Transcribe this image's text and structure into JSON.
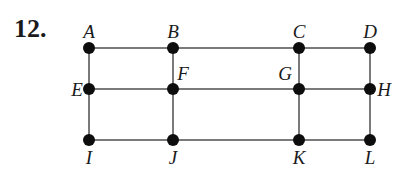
{
  "problem_number": "12.",
  "colors": {
    "edge": "#7a7a7a",
    "node": "#0d0d0d",
    "text": "#1a1a1a"
  },
  "nodes": [
    {
      "id": "A",
      "x": 89,
      "y": 48,
      "lx": 89,
      "ly": 38,
      "anchor": "middle"
    },
    {
      "id": "B",
      "x": 173,
      "y": 48,
      "lx": 173,
      "ly": 38,
      "anchor": "middle"
    },
    {
      "id": "C",
      "x": 299,
      "y": 48,
      "lx": 299,
      "ly": 38,
      "anchor": "middle"
    },
    {
      "id": "D",
      "x": 370,
      "y": 48,
      "lx": 370,
      "ly": 38,
      "anchor": "middle"
    },
    {
      "id": "E",
      "x": 89,
      "y": 89,
      "lx": 77,
      "ly": 96,
      "anchor": "middle"
    },
    {
      "id": "F",
      "x": 173,
      "y": 89,
      "lx": 183,
      "ly": 80,
      "anchor": "middle"
    },
    {
      "id": "G",
      "x": 299,
      "y": 89,
      "lx": 285,
      "ly": 80,
      "anchor": "middle"
    },
    {
      "id": "H",
      "x": 370,
      "y": 89,
      "lx": 384,
      "ly": 96,
      "anchor": "middle"
    },
    {
      "id": "I",
      "x": 89,
      "y": 140,
      "lx": 89,
      "ly": 164,
      "anchor": "middle"
    },
    {
      "id": "J",
      "x": 173,
      "y": 140,
      "lx": 173,
      "ly": 164,
      "anchor": "middle"
    },
    {
      "id": "K",
      "x": 299,
      "y": 140,
      "lx": 299,
      "ly": 164,
      "anchor": "middle"
    },
    {
      "id": "L",
      "x": 370,
      "y": 140,
      "lx": 370,
      "ly": 164,
      "anchor": "middle"
    }
  ],
  "edges": [
    [
      "A",
      "B"
    ],
    [
      "B",
      "C"
    ],
    [
      "C",
      "D"
    ],
    [
      "E",
      "F"
    ],
    [
      "F",
      "G"
    ],
    [
      "G",
      "H"
    ],
    [
      "I",
      "J"
    ],
    [
      "J",
      "K"
    ],
    [
      "K",
      "L"
    ],
    [
      "A",
      "E"
    ],
    [
      "E",
      "I"
    ],
    [
      "B",
      "F"
    ],
    [
      "F",
      "J"
    ],
    [
      "C",
      "G"
    ],
    [
      "G",
      "K"
    ],
    [
      "D",
      "H"
    ],
    [
      "H",
      "L"
    ]
  ]
}
